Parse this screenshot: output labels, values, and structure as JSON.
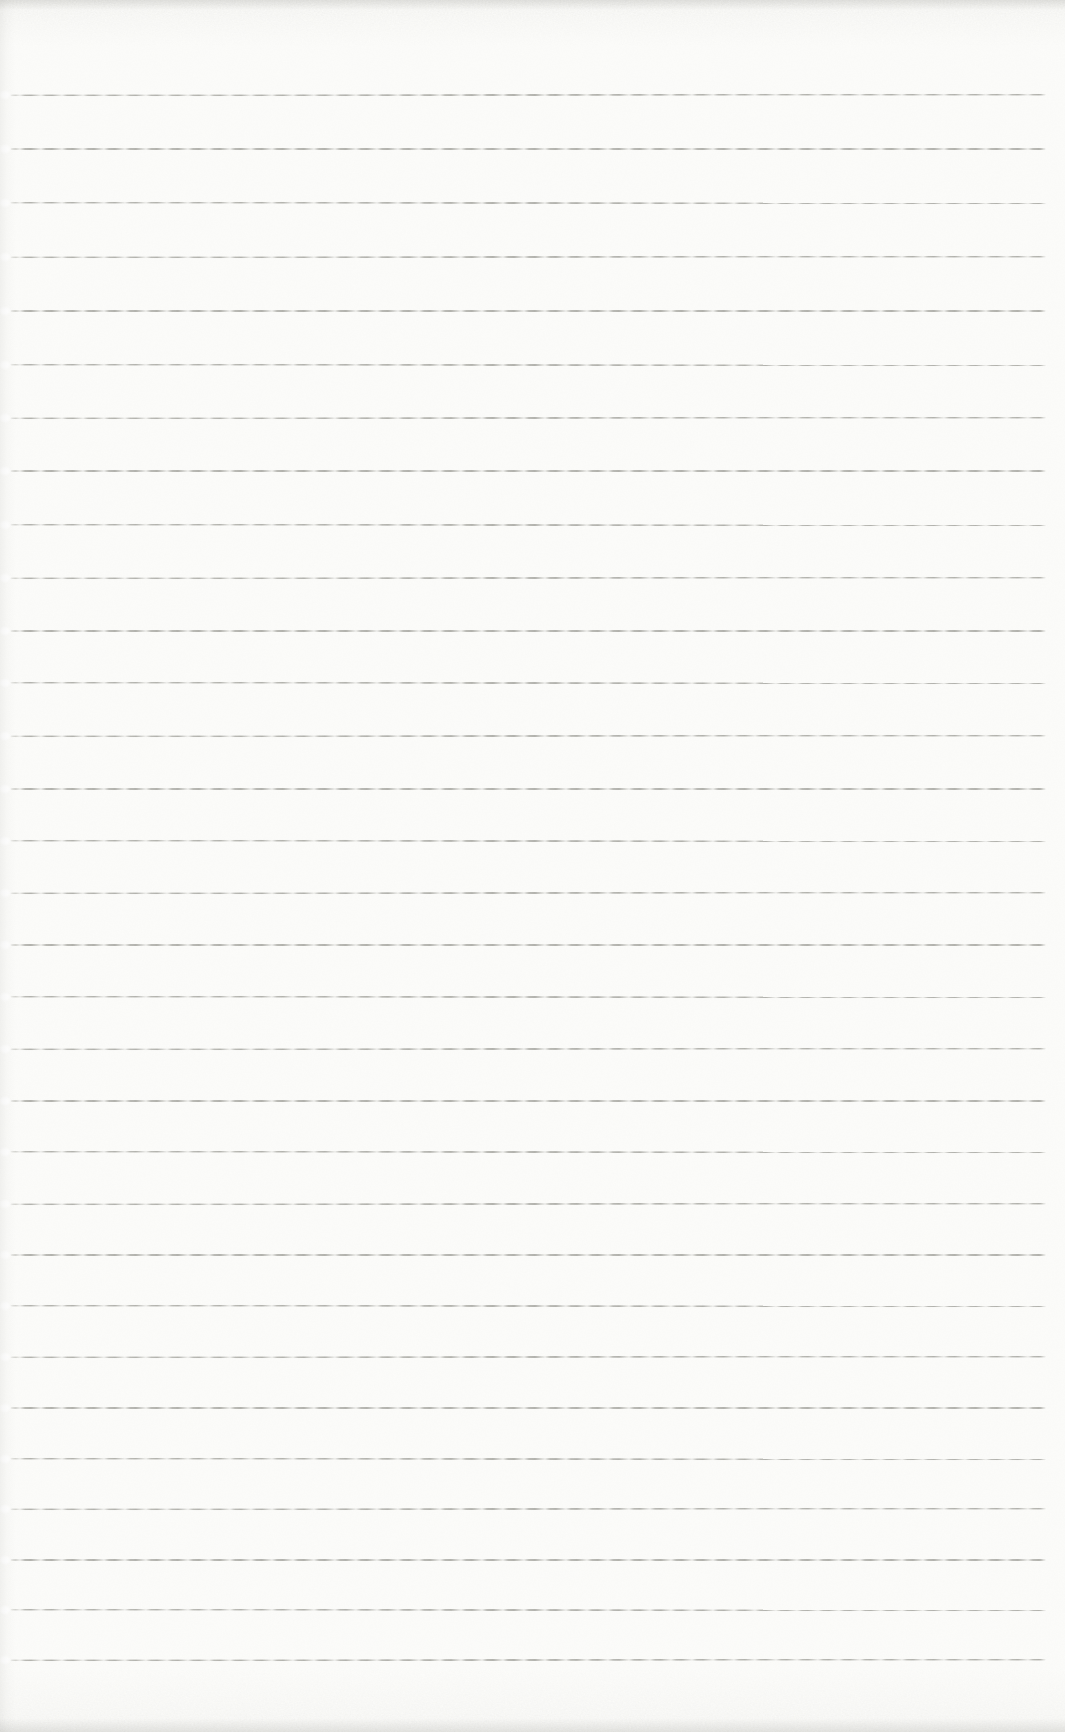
{
  "page": {
    "kind": "scanned-blank-ruled-notebook-page",
    "text_content": "",
    "colors": {
      "paper": "#fcfcfa",
      "rule_line": "#76766e",
      "edge_grain": "#8c8c86"
    },
    "ruled_lines": {
      "count": 31,
      "first_y": 95,
      "last_y": 1660,
      "left_x": 10,
      "right_x": 1046,
      "curve": 0.04
    }
  }
}
